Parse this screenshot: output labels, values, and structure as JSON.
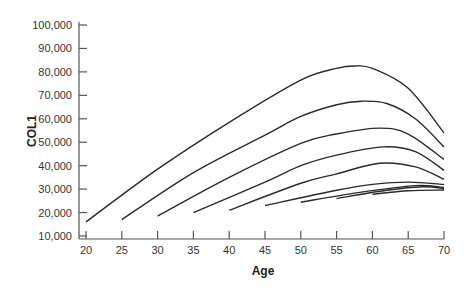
{
  "chart_data": {
    "type": "line",
    "title": "",
    "xlabel": "Age",
    "ylabel": "COL1",
    "xlim": [
      20,
      70
    ],
    "ylim": [
      10000,
      100000
    ],
    "grid": false,
    "legend": "none",
    "x_ticks": [
      20,
      25,
      30,
      35,
      40,
      45,
      50,
      55,
      60,
      65,
      70
    ],
    "x_tick_labels": [
      "20",
      "25",
      "30",
      "35",
      "40",
      "45",
      "50",
      "55",
      "60",
      "65",
      "70"
    ],
    "y_ticks": [
      10000,
      20000,
      30000,
      40000,
      50000,
      60000,
      70000,
      80000,
      90000,
      100000
    ],
    "y_tick_labels": [
      "10,000",
      "20,000",
      "30,000",
      "40,000",
      "50,000",
      "60,000",
      "70,000",
      "80,000",
      "90,000",
      "100,000"
    ],
    "series": [
      {
        "name": "start-20",
        "x": [
          20,
          30,
          40,
          50,
          55,
          57.5,
          60,
          65,
          70
        ],
        "y": [
          16000,
          38500,
          58500,
          76500,
          81500,
          82500,
          81500,
          73000,
          54000
        ]
      },
      {
        "name": "start-25",
        "x": [
          25,
          35,
          45,
          50,
          55,
          58.5,
          62,
          66,
          70
        ],
        "y": [
          17000,
          37000,
          53000,
          61000,
          66000,
          67500,
          66500,
          60000,
          48000
        ]
      },
      {
        "name": "start-30",
        "x": [
          30,
          40,
          50,
          55,
          61,
          65,
          70
        ],
        "y": [
          18500,
          35000,
          49500,
          53500,
          56000,
          53500,
          42700
        ]
      },
      {
        "name": "start-35",
        "x": [
          35,
          45,
          50,
          55,
          61.5,
          66,
          70
        ],
        "y": [
          20000,
          33000,
          40000,
          44500,
          48000,
          46000,
          38000
        ]
      },
      {
        "name": "start-40",
        "x": [
          40,
          50,
          55,
          61,
          66,
          70
        ],
        "y": [
          21000,
          32500,
          36500,
          41000,
          39500,
          34200
        ]
      },
      {
        "name": "start-45",
        "x": [
          45,
          55,
          60,
          65,
          70
        ],
        "y": [
          23000,
          29500,
          32000,
          33000,
          32000
        ]
      },
      {
        "name": "start-50",
        "x": [
          50,
          58,
          66,
          70
        ],
        "y": [
          24400,
          28500,
          31500,
          30700
        ]
      },
      {
        "name": "start-55",
        "x": [
          55,
          62,
          67,
          70
        ],
        "y": [
          26000,
          29500,
          31000,
          30300
        ]
      },
      {
        "name": "start-60",
        "x": [
          60,
          65,
          70
        ],
        "y": [
          27800,
          29300,
          29600
        ]
      }
    ]
  }
}
